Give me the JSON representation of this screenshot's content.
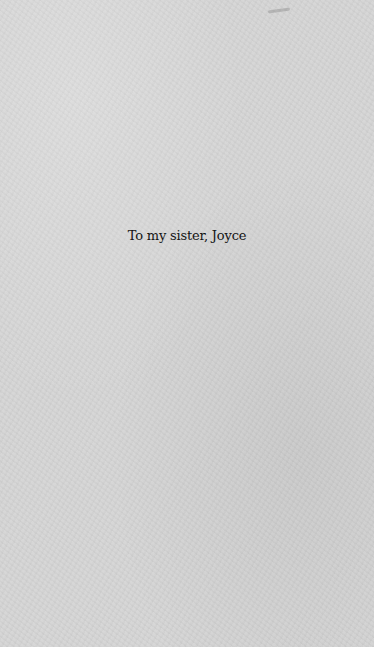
{
  "page": {
    "type": "dedication-page",
    "background_color": "#d5d5d5",
    "text_color": "#141414"
  },
  "dedication": {
    "text": "To my sister, Joyce"
  }
}
